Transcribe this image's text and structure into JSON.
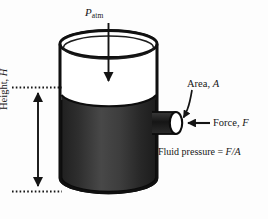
{
  "figure": {
    "background_color": "#fdfdfd",
    "ink_color": "#161616",
    "fluid_color_dark": "#2a2a2a",
    "fluid_color_light": "#4a4a4a"
  },
  "labels": {
    "atmospheric_pressure": {
      "symbol": "P",
      "subscript": "atm",
      "name": "atmospheric-pressure"
    },
    "area": {
      "text": "Area, ",
      "symbol": "A"
    },
    "force": {
      "text": "Force, ",
      "symbol": "F"
    },
    "pressure_formula": {
      "text": "Fluid pressure = ",
      "symbol": "F/A"
    },
    "height": {
      "text": "Height, ",
      "symbol": "H"
    }
  },
  "elements": {
    "cylinder": "tank-cylinder",
    "fluid": "fluid-body",
    "nozzle": "outlet-nozzle",
    "nozzle_opening": "nozzle-opening",
    "down_arrow": "atmospheric-pressure-arrow",
    "force_arrow": "force-arrow",
    "area_leader": "area-leader-line",
    "height_arrow": "height-dimension-arrow",
    "guide_top": "height-guide-line-top",
    "guide_bottom": "height-guide-line-bottom"
  },
  "geometry": {
    "cylinder_left": 60,
    "cylinder_right": 157,
    "cylinder_top": 36,
    "cylinder_bottom": 191,
    "fluid_surface": 93,
    "nozzle_y": 122
  }
}
